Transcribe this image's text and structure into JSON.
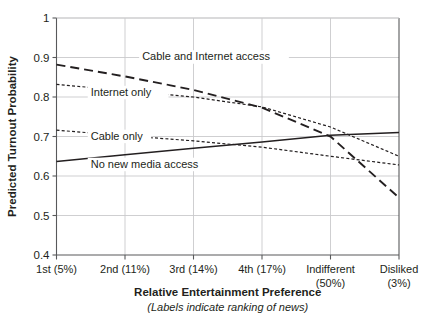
{
  "figure": {
    "background_color": "#ffffff",
    "ink_color": "#231f20",
    "grid_color": "#c9cacc"
  },
  "chart_data": {
    "type": "line",
    "title": "",
    "xlabel": "Relative Entertainment Preference",
    "xlabel_note": "(Labels indicate ranking of news)",
    "ylabel": "Predicted Turnout Probability",
    "categories": [
      "1st (5%)",
      "2nd (11%)",
      "3rd (14%)",
      "4th (17%)",
      "Indifferent (50%)",
      "Disliked (3%)"
    ],
    "x_tick_lines": [
      [
        "1st (5%)"
      ],
      [
        "2nd (11%)"
      ],
      [
        "3rd (14%)"
      ],
      [
        "4th (17%)"
      ],
      [
        "Indifferent",
        "(50%)"
      ],
      [
        "Disliked",
        "(3%)"
      ]
    ],
    "ylim": [
      0.4,
      1.0
    ],
    "yticks": [
      0.4,
      0.5,
      0.6,
      0.7,
      0.8,
      0.9,
      1
    ],
    "ytick_labels": [
      "0.4",
      "0.5",
      "0.6",
      "0.7",
      "0.8",
      "0.9",
      "1"
    ],
    "grid": true,
    "grid_axis": "y",
    "legend_position": "inline-annotations",
    "series": [
      {
        "name": "Cable and Internet access",
        "label": "Cable and Internet access",
        "style": "long-dash",
        "dasharray": "9,5",
        "width": 1.9,
        "values": [
          0.882,
          0.852,
          0.818,
          0.773,
          0.7,
          0.545
        ],
        "label_x": 0.25,
        "label_y": 0.893
      },
      {
        "name": "Internet only",
        "label": "Internet only",
        "style": "fine-dash",
        "dasharray": "3,2.2",
        "width": 1.2,
        "values": [
          0.832,
          0.816,
          0.8,
          0.775,
          0.724,
          0.65
        ],
        "label_x": 0.1,
        "label_y": 0.803
      },
      {
        "name": "Cable only",
        "label": "Cable only",
        "style": "fine-dash",
        "dasharray": "3,2.2",
        "width": 1.2,
        "values": [
          0.716,
          0.702,
          0.689,
          0.673,
          0.65,
          0.628
        ],
        "label_x": 0.1,
        "label_y": 0.692
      },
      {
        "name": "No new media access",
        "label": "No new media access",
        "style": "solid",
        "dasharray": "none",
        "width": 1.5,
        "values": [
          0.637,
          0.654,
          0.67,
          0.686,
          0.703,
          0.71
        ],
        "label_x": 0.1,
        "label_y": 0.621
      }
    ]
  }
}
